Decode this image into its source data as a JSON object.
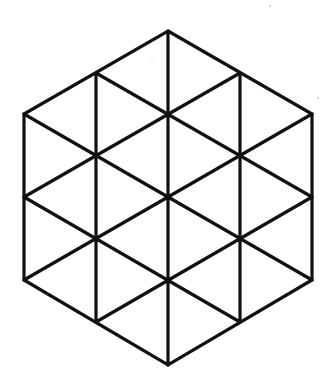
{
  "figure": {
    "stroke_color": "#111111",
    "background_color": "#ffffff",
    "stroke_width": 3.2,
    "hexagon_vertices": [
      [
        168,
        31
      ],
      [
        312,
        114
      ],
      [
        312,
        280
      ],
      [
        168,
        365
      ],
      [
        24,
        280
      ],
      [
        24,
        114
      ]
    ],
    "vertical_lines": [
      [
        [
          96,
          73
        ],
        [
          96,
          322
        ]
      ],
      [
        [
          168,
          31
        ],
        [
          168,
          365
        ]
      ],
      [
        [
          240,
          73
        ],
        [
          240,
          322
        ]
      ]
    ],
    "diagonal_down_lines": [
      [
        [
          96,
          73
        ],
        [
          312,
          197
        ]
      ],
      [
        [
          24,
          114
        ],
        [
          312,
          280
        ]
      ],
      [
        [
          24,
          197
        ],
        [
          240,
          322
        ]
      ]
    ],
    "diagonal_up_lines": [
      [
        [
          24,
          197
        ],
        [
          240,
          73
        ]
      ],
      [
        [
          24,
          280
        ],
        [
          312,
          114
        ]
      ],
      [
        [
          96,
          322
        ],
        [
          312,
          197
        ]
      ]
    ]
  }
}
